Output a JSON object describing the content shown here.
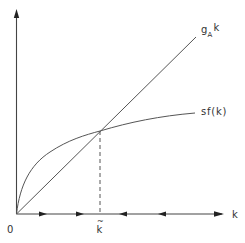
{
  "diagram": {
    "colors": {
      "ink": "#444444",
      "background": "#ffffff",
      "label": "#333333"
    },
    "axes": {
      "origin_label": "0",
      "x_label": "k",
      "y_label": ""
    },
    "curves": [
      {
        "id": "line",
        "label_main": "g",
        "label_sub": "A",
        "label_tail": "k",
        "kind": "straight line through origin"
      },
      {
        "id": "curve",
        "label": "sf(k)",
        "kind": "concave curve through origin"
      }
    ],
    "steady_state": {
      "label": "k",
      "accent": "~",
      "marker": "dashed vertical line from intersection to k-axis"
    },
    "phase_arrows": [
      {
        "position": "left-1",
        "direction": "right"
      },
      {
        "position": "left-2",
        "direction": "right"
      },
      {
        "position": "right-1",
        "direction": "left"
      },
      {
        "position": "right-2",
        "direction": "left"
      },
      {
        "position": "axis-end",
        "direction": "right"
      }
    ]
  }
}
